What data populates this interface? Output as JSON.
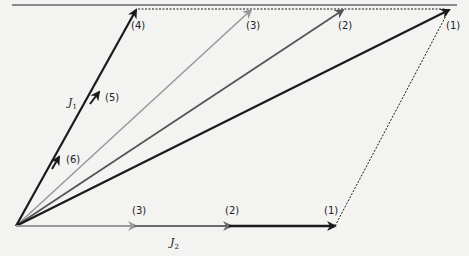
{
  "diagram": {
    "title": "",
    "origin": [
      16,
      226
    ],
    "colors": {
      "black": "#1a1a1a",
      "dark_gray": "#555555",
      "mid_gray": "#7a7a7a",
      "light_gray": "#9a9a9a",
      "rule": "#666666",
      "background": "#f3f3f1"
    },
    "top_rule": {
      "x1": 12,
      "x2": 457,
      "y": 5
    },
    "vectors": {
      "J1": {
        "label": "J",
        "subscript": "1",
        "label_pos": [
          36,
          106
        ],
        "from": [
          16,
          226
        ],
        "to": [
          136,
          9
        ]
      },
      "J2": {
        "label": "J",
        "subscript": "2",
        "label_pos": [
          170,
          247
        ],
        "from": [
          16,
          226
        ],
        "to": [
          335,
          226
        ]
      }
    },
    "resultants": [
      {
        "label": "(1)",
        "to": [
          449,
          9
        ],
        "color": "#1a1a1a",
        "width": 2.2
      },
      {
        "label": "(2)",
        "to": [
          343,
          9
        ],
        "color": "#555555",
        "width": 1.8
      },
      {
        "label": "(3)",
        "to": [
          251,
          9
        ],
        "color": "#9a9a9a",
        "width": 1.6
      }
    ],
    "top_labels": [
      {
        "text": "(4)",
        "x": 136,
        "y": 3
      },
      {
        "text": "(3)",
        "x": 251,
        "y": 3
      },
      {
        "text": "(2)",
        "x": 343,
        "y": 3
      },
      {
        "text": "(1)",
        "x": 451,
        "y": 3
      }
    ],
    "j1_labels": [
      {
        "text": "(5)",
        "x": 110,
        "y": 99
      },
      {
        "text": "(6)",
        "x": 70,
        "y": 162
      }
    ],
    "j2_labels": [
      {
        "text": "(3)",
        "x": 140,
        "y": 214
      },
      {
        "text": "(2)",
        "x": 233,
        "y": 214
      },
      {
        "text": "(1)",
        "x": 330,
        "y": 214
      }
    ]
  }
}
